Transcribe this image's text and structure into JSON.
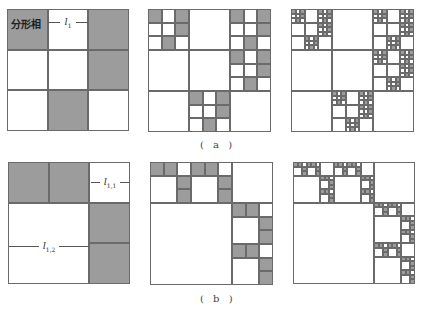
{
  "figure": {
    "rows": [
      {
        "caption": "( a )",
        "generator": {
          "grid": 3,
          "gray_cells": [
            [
              0,
              0
            ],
            [
              0,
              2
            ],
            [
              1,
              2
            ],
            [
              2,
              1
            ]
          ]
        },
        "panels": [
          {
            "level": 1,
            "x": 7,
            "y": 9,
            "size": 122
          },
          {
            "level": 2,
            "x": 148,
            "y": 9,
            "size": 123
          },
          {
            "level": 3,
            "x": 291,
            "y": 9,
            "size": 123
          }
        ],
        "annotations": {
          "phase_label": "分形相",
          "dimension_label": "l",
          "dimension_sub": "1"
        }
      },
      {
        "caption": "( b )",
        "generator": {
          "grid": 3,
          "gray_cells": [
            [
              0,
              0
            ],
            [
              0,
              1
            ],
            [
              1,
              2
            ],
            [
              2,
              2
            ]
          ],
          "merged_white": [
            [
              1,
              0
            ],
            [
              1,
              1
            ],
            [
              2,
              0
            ],
            [
              2,
              1
            ]
          ]
        },
        "panels": [
          {
            "level": 1,
            "x": 8,
            "y": 162,
            "size": 122
          },
          {
            "level": 2,
            "x": 150,
            "y": 162,
            "size": 123
          },
          {
            "level": 3,
            "x": 293,
            "y": 162,
            "size": 122
          }
        ],
        "annotations": {
          "dimension_label_1": "l",
          "dimension_sub_1": "1,1",
          "dimension_label_2": "l",
          "dimension_sub_2": "1,2"
        }
      }
    ],
    "colors": {
      "gray_fill": "#9c9c9c",
      "line": "#6a6a6a",
      "background": "#ffffff"
    }
  }
}
